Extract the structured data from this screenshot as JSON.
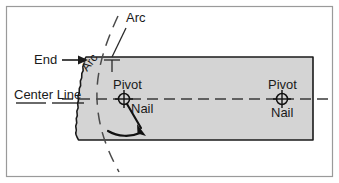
{
  "figure": {
    "background_color": "#ffffff",
    "frame_color": "#9a9a9a",
    "board_fill": "#d4d4d4",
    "board_outline": "#1a1a1a",
    "line_color": "#1a1a1a",
    "dash_color": "#555555"
  },
  "labels": {
    "arc_top": "Arc",
    "arc_rotated": "Arc",
    "end": "End",
    "center_line": "Center Line",
    "pivot_left": "Pivot",
    "nail_left": "Nail",
    "pivot_right": "Pivot",
    "nail_right": "Nail"
  },
  "icons": {
    "pivot_left": "crosshair-target-icon",
    "pivot_right": "crosshair-target-icon",
    "end_pointer": "arrow-right-icon",
    "swing_direction": "curved-arrow-icon"
  },
  "geometry": {
    "board": {
      "left": 78,
      "right": 313,
      "top": 57,
      "bottom": 140
    },
    "center_line_y": 99,
    "pivot_left": {
      "x": 124,
      "y": 99
    },
    "pivot_right": {
      "x": 282,
      "y": 99
    },
    "pivot_radius": 5.5
  }
}
